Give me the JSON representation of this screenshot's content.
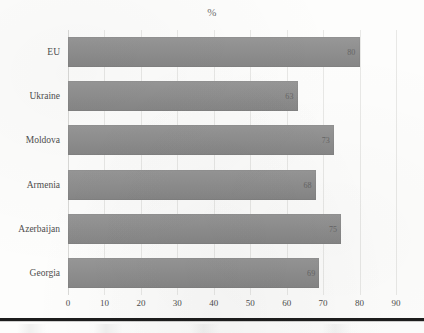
{
  "chart_data": {
    "type": "bar",
    "orientation": "horizontal",
    "title": "%",
    "xlabel": "",
    "ylabel": "",
    "categories": [
      "EU",
      "Ukraine",
      "Moldova",
      "Armenia",
      "Azerbaijan",
      "Georgia"
    ],
    "values": [
      80,
      63,
      73,
      68,
      75,
      69
    ],
    "value_labels": [
      "80",
      "63",
      "73",
      "68",
      "75",
      "69"
    ],
    "xlim": [
      0,
      90
    ],
    "xticks": [
      0,
      10,
      20,
      30,
      40,
      50,
      60,
      70,
      80,
      90
    ],
    "xtick_labels": [
      "0",
      "10",
      "20",
      "30",
      "40",
      "50",
      "60",
      "70",
      "80",
      "90"
    ],
    "grid": true,
    "grid_axis": "x",
    "legend": false,
    "bar_color": "#8d8d8d",
    "series": [
      {
        "name": "%",
        "values": [
          80,
          63,
          73,
          68,
          75,
          69
        ]
      }
    ]
  },
  "axis": {
    "x_tick_labels": [
      "0",
      "10",
      "20",
      "30",
      "40",
      "50",
      "60",
      "70",
      "80",
      "90"
    ],
    "category_labels": [
      "EU",
      "Ukraine",
      "Moldova",
      "Armenia",
      "Azerbaijan",
      "Georgia"
    ]
  },
  "bars": [
    {
      "category": "EU",
      "value": 80,
      "label": "80"
    },
    {
      "category": "Ukraine",
      "value": 63,
      "label": "63"
    },
    {
      "category": "Moldova",
      "value": 73,
      "label": "73"
    },
    {
      "category": "Armenia",
      "value": 68,
      "label": "68"
    },
    {
      "category": "Azerbaijan",
      "value": 75,
      "label": "75"
    },
    {
      "category": "Georgia",
      "value": 69,
      "label": "69"
    }
  ],
  "colors": {
    "bar": "#8d8d8d",
    "gridline": "#e8e8e6",
    "rule": "#1d1d1d",
    "text": "#4d4d4d"
  }
}
